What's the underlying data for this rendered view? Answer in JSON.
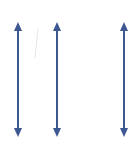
{
  "diagram": {
    "arrow_color": "#3d5790",
    "arrows": [
      {
        "x": 18,
        "y_top": 22,
        "y_bottom": 137
      },
      {
        "x": 57,
        "y_top": 22,
        "y_bottom": 137
      },
      {
        "x": 124,
        "y_top": 22,
        "y_bottom": 137
      }
    ]
  }
}
